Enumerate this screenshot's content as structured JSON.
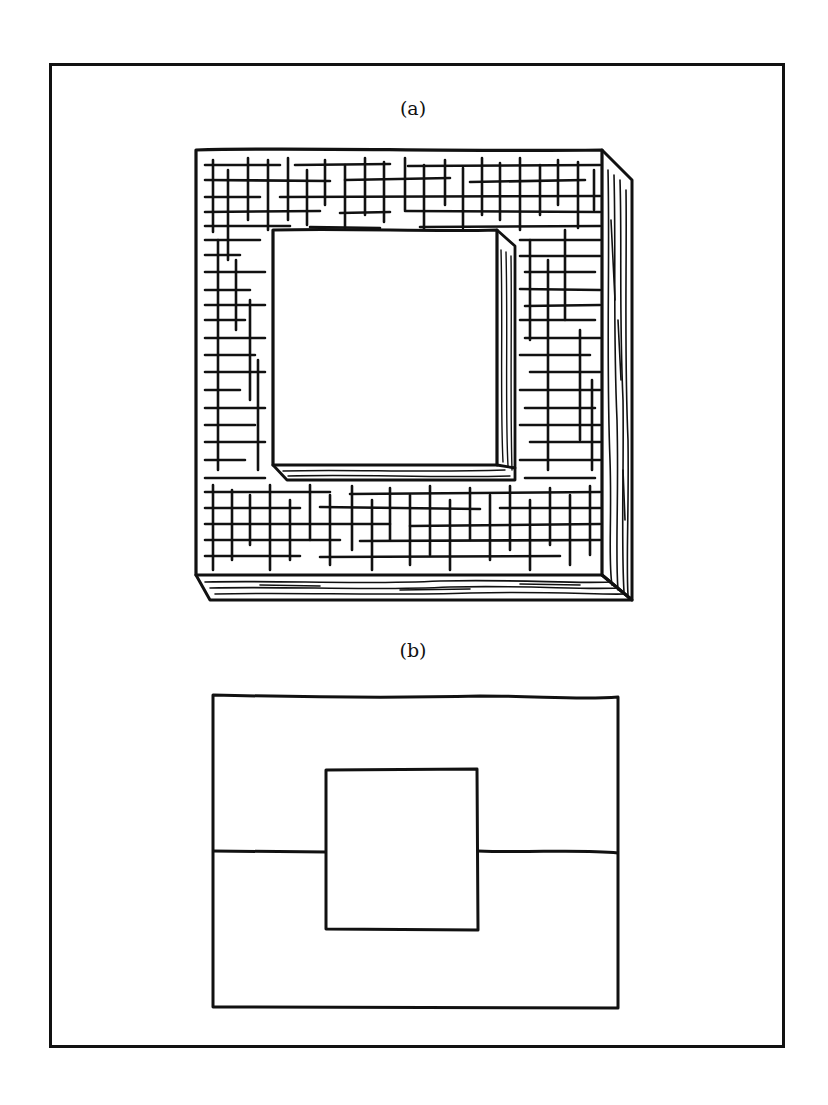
{
  "figure": {
    "panel_a": {
      "label": "(a)",
      "description": "3D square wall with brick-like grid texture and a square opening"
    },
    "panel_b": {
      "label": "(b)",
      "description": "Outline: rectangle with central square and horizontal line through middle"
    },
    "colors": {
      "ink": "#111111",
      "background": "#ffffff"
    }
  }
}
